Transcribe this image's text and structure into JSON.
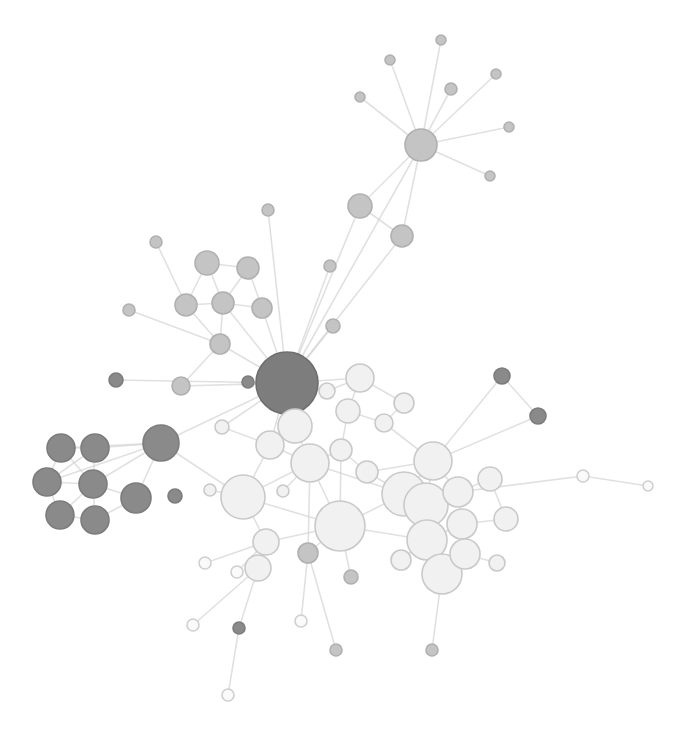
{
  "diagram": {
    "type": "network-graph",
    "colors": {
      "background": "#ffffff",
      "edge": "#d4d4d4",
      "light_node_fill": "#f1f1f1",
      "light_node_stroke": "#c9c9c9",
      "mid_node_fill": "#c4c4c4",
      "dark_node_fill": "#8a8a8a",
      "hub_node_fill": "#7d7d7d"
    },
    "nodes": [
      {
        "id": "hub",
        "x": 287,
        "y": 383,
        "r": 31,
        "tone": "hub"
      },
      {
        "id": "d1",
        "x": 61,
        "y": 448,
        "r": 14,
        "tone": "dark"
      },
      {
        "id": "d2",
        "x": 95,
        "y": 448,
        "r": 14,
        "tone": "dark"
      },
      {
        "id": "d3",
        "x": 47,
        "y": 482,
        "r": 14,
        "tone": "dark"
      },
      {
        "id": "d4",
        "x": 93,
        "y": 484,
        "r": 14,
        "tone": "dark"
      },
      {
        "id": "d5",
        "x": 60,
        "y": 515,
        "r": 14,
        "tone": "dark"
      },
      {
        "id": "d6",
        "x": 95,
        "y": 520,
        "r": 14,
        "tone": "dark"
      },
      {
        "id": "d7",
        "x": 136,
        "y": 498,
        "r": 15,
        "tone": "dark"
      },
      {
        "id": "d8",
        "x": 161,
        "y": 443,
        "r": 18,
        "tone": "dark"
      },
      {
        "id": "d9",
        "x": 175,
        "y": 496,
        "r": 7,
        "tone": "dark"
      },
      {
        "id": "d10",
        "x": 116,
        "y": 380,
        "r": 7,
        "tone": "dark"
      },
      {
        "id": "d11",
        "x": 248,
        "y": 382,
        "r": 6,
        "tone": "dark"
      },
      {
        "id": "d12",
        "x": 502,
        "y": 376,
        "r": 8,
        "tone": "dark"
      },
      {
        "id": "d13",
        "x": 538,
        "y": 416,
        "r": 8,
        "tone": "dark"
      },
      {
        "id": "d14",
        "x": 239,
        "y": 628,
        "r": 6,
        "tone": "dark"
      },
      {
        "id": "m1",
        "x": 207,
        "y": 263,
        "r": 12,
        "tone": "mid"
      },
      {
        "id": "m2",
        "x": 248,
        "y": 268,
        "r": 11,
        "tone": "mid"
      },
      {
        "id": "m3",
        "x": 186,
        "y": 305,
        "r": 11,
        "tone": "mid"
      },
      {
        "id": "m4",
        "x": 223,
        "y": 303,
        "r": 11,
        "tone": "mid"
      },
      {
        "id": "m5",
        "x": 262,
        "y": 308,
        "r": 10,
        "tone": "mid"
      },
      {
        "id": "m6",
        "x": 220,
        "y": 344,
        "r": 10,
        "tone": "mid"
      },
      {
        "id": "m7",
        "x": 181,
        "y": 386,
        "r": 9,
        "tone": "mid"
      },
      {
        "id": "m8",
        "x": 156,
        "y": 242,
        "r": 6,
        "tone": "mid"
      },
      {
        "id": "m9",
        "x": 129,
        "y": 310,
        "r": 6,
        "tone": "mid"
      },
      {
        "id": "m10",
        "x": 268,
        "y": 210,
        "r": 6,
        "tone": "mid"
      },
      {
        "id": "m11",
        "x": 330,
        "y": 266,
        "r": 6,
        "tone": "mid"
      },
      {
        "id": "m12",
        "x": 333,
        "y": 326,
        "r": 7,
        "tone": "mid"
      },
      {
        "id": "m13",
        "x": 308,
        "y": 553,
        "r": 10,
        "tone": "mid"
      },
      {
        "id": "m14",
        "x": 351,
        "y": 577,
        "r": 7,
        "tone": "mid"
      },
      {
        "id": "m15",
        "x": 336,
        "y": 650,
        "r": 6,
        "tone": "mid"
      },
      {
        "id": "m16",
        "x": 432,
        "y": 650,
        "r": 6,
        "tone": "mid"
      },
      {
        "id": "t1",
        "x": 421,
        "y": 145,
        "r": 16,
        "tone": "mid"
      },
      {
        "id": "t2",
        "x": 360,
        "y": 206,
        "r": 12,
        "tone": "mid"
      },
      {
        "id": "t3",
        "x": 402,
        "y": 236,
        "r": 11,
        "tone": "mid"
      },
      {
        "id": "t4",
        "x": 390,
        "y": 60,
        "r": 5,
        "tone": "mid"
      },
      {
        "id": "t5",
        "x": 441,
        "y": 40,
        "r": 5,
        "tone": "mid"
      },
      {
        "id": "t6",
        "x": 360,
        "y": 97,
        "r": 5,
        "tone": "mid"
      },
      {
        "id": "t7",
        "x": 451,
        "y": 89,
        "r": 6,
        "tone": "mid"
      },
      {
        "id": "t8",
        "x": 496,
        "y": 74,
        "r": 5,
        "tone": "mid"
      },
      {
        "id": "t9",
        "x": 509,
        "y": 127,
        "r": 5,
        "tone": "mid"
      },
      {
        "id": "t10",
        "x": 490,
        "y": 176,
        "r": 5,
        "tone": "mid"
      },
      {
        "id": "l1",
        "x": 295,
        "y": 426,
        "r": 17,
        "tone": "light"
      },
      {
        "id": "l2",
        "x": 270,
        "y": 445,
        "r": 14,
        "tone": "light"
      },
      {
        "id": "l3",
        "x": 310,
        "y": 463,
        "r": 19,
        "tone": "light"
      },
      {
        "id": "l4",
        "x": 243,
        "y": 497,
        "r": 22,
        "tone": "light"
      },
      {
        "id": "l5",
        "x": 340,
        "y": 526,
        "r": 25,
        "tone": "light"
      },
      {
        "id": "l6",
        "x": 266,
        "y": 542,
        "r": 13,
        "tone": "light"
      },
      {
        "id": "l7",
        "x": 258,
        "y": 568,
        "r": 13,
        "tone": "light"
      },
      {
        "id": "l8",
        "x": 327,
        "y": 391,
        "r": 8,
        "tone": "light"
      },
      {
        "id": "l9",
        "x": 360,
        "y": 378,
        "r": 14,
        "tone": "light"
      },
      {
        "id": "l10",
        "x": 404,
        "y": 403,
        "r": 10,
        "tone": "light"
      },
      {
        "id": "l11",
        "x": 348,
        "y": 411,
        "r": 12,
        "tone": "light"
      },
      {
        "id": "l12",
        "x": 384,
        "y": 423,
        "r": 9,
        "tone": "light"
      },
      {
        "id": "l13",
        "x": 341,
        "y": 450,
        "r": 11,
        "tone": "light"
      },
      {
        "id": "l14",
        "x": 367,
        "y": 472,
        "r": 11,
        "tone": "light"
      },
      {
        "id": "l15",
        "x": 433,
        "y": 461,
        "r": 19,
        "tone": "light"
      },
      {
        "id": "l16",
        "x": 404,
        "y": 494,
        "r": 22,
        "tone": "light"
      },
      {
        "id": "l17",
        "x": 426,
        "y": 505,
        "r": 22,
        "tone": "light"
      },
      {
        "id": "l18",
        "x": 458,
        "y": 492,
        "r": 15,
        "tone": "light"
      },
      {
        "id": "l19",
        "x": 490,
        "y": 479,
        "r": 12,
        "tone": "light"
      },
      {
        "id": "l20",
        "x": 427,
        "y": 540,
        "r": 20,
        "tone": "light"
      },
      {
        "id": "l21",
        "x": 462,
        "y": 524,
        "r": 15,
        "tone": "light"
      },
      {
        "id": "l22",
        "x": 465,
        "y": 554,
        "r": 15,
        "tone": "light"
      },
      {
        "id": "l23",
        "x": 442,
        "y": 574,
        "r": 20,
        "tone": "light"
      },
      {
        "id": "l24",
        "x": 506,
        "y": 519,
        "r": 12,
        "tone": "light"
      },
      {
        "id": "l25",
        "x": 401,
        "y": 560,
        "r": 10,
        "tone": "light"
      },
      {
        "id": "l26",
        "x": 497,
        "y": 563,
        "r": 8,
        "tone": "light"
      },
      {
        "id": "l27",
        "x": 222,
        "y": 427,
        "r": 7,
        "tone": "light"
      },
      {
        "id": "l28",
        "x": 210,
        "y": 490,
        "r": 6,
        "tone": "light"
      },
      {
        "id": "l29",
        "x": 283,
        "y": 491,
        "r": 6,
        "tone": "light"
      },
      {
        "id": "p1",
        "x": 583,
        "y": 476,
        "r": 6,
        "tone": "pale"
      },
      {
        "id": "p2",
        "x": 648,
        "y": 486,
        "r": 5,
        "tone": "pale"
      },
      {
        "id": "p3",
        "x": 205,
        "y": 563,
        "r": 6,
        "tone": "pale"
      },
      {
        "id": "p4",
        "x": 237,
        "y": 572,
        "r": 6,
        "tone": "pale"
      },
      {
        "id": "p5",
        "x": 193,
        "y": 625,
        "r": 6,
        "tone": "pale"
      },
      {
        "id": "p6",
        "x": 301,
        "y": 621,
        "r": 6,
        "tone": "pale"
      },
      {
        "id": "p7",
        "x": 228,
        "y": 695,
        "r": 6,
        "tone": "pale"
      }
    ],
    "edges": [
      [
        "hub",
        "d8"
      ],
      [
        "hub",
        "m5"
      ],
      [
        "hub",
        "m6"
      ],
      [
        "hub",
        "m4"
      ],
      [
        "hub",
        "m10"
      ],
      [
        "hub",
        "m11"
      ],
      [
        "hub",
        "m12"
      ],
      [
        "hub",
        "t2"
      ],
      [
        "hub",
        "t3"
      ],
      [
        "hub",
        "t1"
      ],
      [
        "hub",
        "l1"
      ],
      [
        "hub",
        "l2"
      ],
      [
        "hub",
        "l8"
      ],
      [
        "hub",
        "l9"
      ],
      [
        "hub",
        "d11"
      ],
      [
        "hub",
        "m7"
      ],
      [
        "hub",
        "d10"
      ],
      [
        "hub",
        "l27"
      ],
      [
        "d8",
        "d1"
      ],
      [
        "d8",
        "d2"
      ],
      [
        "d8",
        "d3"
      ],
      [
        "d8",
        "d4"
      ],
      [
        "d8",
        "d7"
      ],
      [
        "d8",
        "l4"
      ],
      [
        "d1",
        "d2"
      ],
      [
        "d1",
        "d3"
      ],
      [
        "d1",
        "d4"
      ],
      [
        "d2",
        "d4"
      ],
      [
        "d3",
        "d4"
      ],
      [
        "d3",
        "d5"
      ],
      [
        "d4",
        "d5"
      ],
      [
        "d4",
        "d6"
      ],
      [
        "d5",
        "d6"
      ],
      [
        "d4",
        "d7"
      ],
      [
        "d6",
        "d7"
      ],
      [
        "d2",
        "d3"
      ],
      [
        "m1",
        "m2"
      ],
      [
        "m1",
        "m3"
      ],
      [
        "m1",
        "m4"
      ],
      [
        "m2",
        "m4"
      ],
      [
        "m2",
        "m5"
      ],
      [
        "m3",
        "m4"
      ],
      [
        "m4",
        "m5"
      ],
      [
        "m3",
        "m6"
      ],
      [
        "m4",
        "m6"
      ],
      [
        "m8",
        "m3"
      ],
      [
        "m9",
        "m6"
      ],
      [
        "m6",
        "m7"
      ],
      [
        "t1",
        "t2"
      ],
      [
        "t1",
        "t3"
      ],
      [
        "t1",
        "t4"
      ],
      [
        "t1",
        "t5"
      ],
      [
        "t1",
        "t6"
      ],
      [
        "t1",
        "t7"
      ],
      [
        "t1",
        "t8"
      ],
      [
        "t1",
        "t9"
      ],
      [
        "t1",
        "t10"
      ],
      [
        "t2",
        "t3"
      ],
      [
        "l1",
        "l2"
      ],
      [
        "l1",
        "l3"
      ],
      [
        "l2",
        "l3"
      ],
      [
        "l2",
        "l4"
      ],
      [
        "l3",
        "l4"
      ],
      [
        "l3",
        "l5"
      ],
      [
        "l3",
        "l13"
      ],
      [
        "l4",
        "l6"
      ],
      [
        "l4",
        "l5"
      ],
      [
        "l5",
        "l6"
      ],
      [
        "l6",
        "l7"
      ],
      [
        "l5",
        "l13"
      ],
      [
        "l5",
        "l16"
      ],
      [
        "l8",
        "l9"
      ],
      [
        "l9",
        "l11"
      ],
      [
        "l9",
        "l10"
      ],
      [
        "l11",
        "l12"
      ],
      [
        "l11",
        "l13"
      ],
      [
        "l12",
        "l15"
      ],
      [
        "l13",
        "l14"
      ],
      [
        "l14",
        "l15"
      ],
      [
        "l14",
        "l16"
      ],
      [
        "l15",
        "l16"
      ],
      [
        "l15",
        "l17"
      ],
      [
        "l15",
        "l18"
      ],
      [
        "l16",
        "l17"
      ],
      [
        "l17",
        "l18"
      ],
      [
        "l18",
        "l19"
      ],
      [
        "l17",
        "l20"
      ],
      [
        "l18",
        "l21"
      ],
      [
        "l20",
        "l21"
      ],
      [
        "l21",
        "l22"
      ],
      [
        "l20",
        "l23"
      ],
      [
        "l22",
        "l23"
      ],
      [
        "l21",
        "l24"
      ],
      [
        "l19",
        "l24"
      ],
      [
        "l20",
        "l25"
      ],
      [
        "l22",
        "l26"
      ],
      [
        "l5",
        "l20"
      ],
      [
        "l3",
        "l16"
      ],
      [
        "l10",
        "l12"
      ],
      [
        "l2",
        "l27"
      ],
      [
        "l4",
        "l28"
      ],
      [
        "l3",
        "l29"
      ],
      [
        "l15",
        "d12"
      ],
      [
        "l15",
        "d13"
      ],
      [
        "d12",
        "d13"
      ],
      [
        "l18",
        "p1"
      ],
      [
        "p1",
        "p2"
      ],
      [
        "l6",
        "p3"
      ],
      [
        "l6",
        "p4"
      ],
      [
        "l7",
        "p5"
      ],
      [
        "l5",
        "m13"
      ],
      [
        "l5",
        "m14"
      ],
      [
        "m13",
        "p6"
      ],
      [
        "m13",
        "m15"
      ],
      [
        "l23",
        "m16"
      ],
      [
        "l7",
        "d14"
      ],
      [
        "d14",
        "p7"
      ],
      [
        "l3",
        "m13"
      ]
    ]
  }
}
